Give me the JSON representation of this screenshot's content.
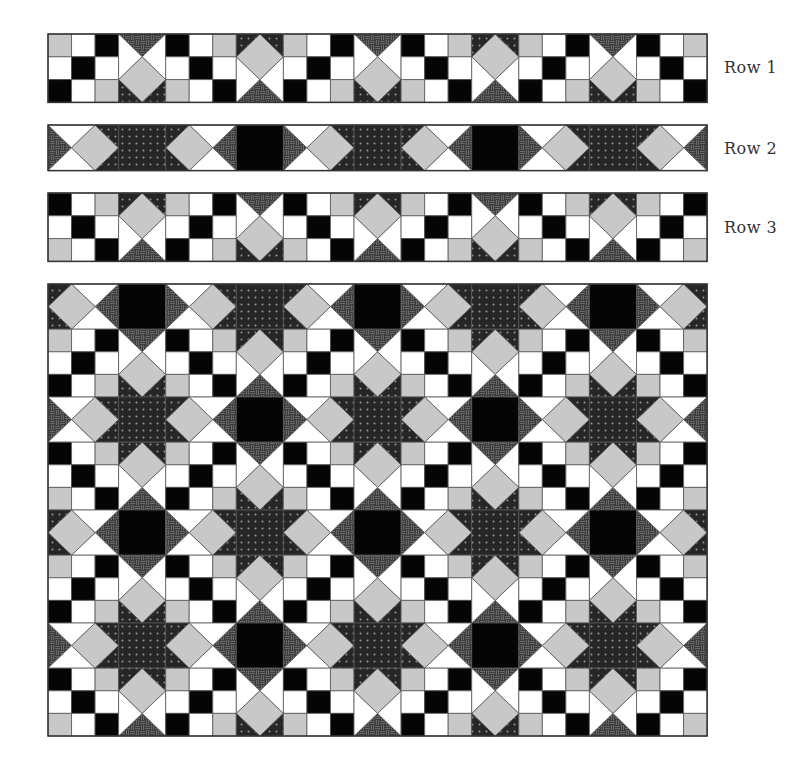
{
  "labels": {
    "row1": "Row 1",
    "row2": "Row 2",
    "row3": "Row 3"
  },
  "label_positions": {
    "row1": {
      "x": 724,
      "y": 58
    },
    "row2": {
      "x": 724,
      "y": 139
    },
    "row3": {
      "x": 724,
      "y": 218
    }
  },
  "colors": {
    "white": "#ffffff",
    "gray": "#c8c8c8",
    "black": "#050505",
    "dotted_bg": "#262626",
    "dotted_dot": "#9a9a9a",
    "striped_bg": "#3c3c3c",
    "striped_line": "#8a8a8a",
    "outline": "#555555"
  },
  "grid": {
    "x0": 48,
    "cell_w": 23.54,
    "columns": [
      "NP",
      "D",
      "NP",
      "D",
      "NP",
      "D",
      "NP",
      "D",
      "NP",
      "D",
      "NP"
    ]
  },
  "strips": [
    {
      "name": "row-1-strip",
      "y": 34,
      "cell_h": 22.8,
      "band": "R1"
    },
    {
      "name": "row-2-strip",
      "y": 125,
      "cell_h": 22.8,
      "band": "R2"
    },
    {
      "name": "row-3-strip",
      "y": 193,
      "cell_h": 22.8,
      "band": "R3"
    }
  ],
  "assembled_quilt": {
    "name": "assembled-quilt",
    "y": 284,
    "cell_h": 22.6,
    "bands": [
      "A2",
      "R1",
      "R2",
      "R3",
      "A2",
      "R1",
      "R2",
      "R3"
    ]
  },
  "band_defs": {
    "R1": {
      "height_cells": 3,
      "blocks": [
        "NPB",
        "DT",
        "NPA",
        "DB",
        "NPB",
        "DT",
        "NPA",
        "DB",
        "NPB",
        "DT",
        "NPA"
      ]
    },
    "R3": {
      "height_cells": 3,
      "blocks": [
        "NPA",
        "DB",
        "NPB",
        "DT",
        "NPA",
        "DB",
        "NPB",
        "DT",
        "NPA",
        "DB",
        "NPB"
      ]
    },
    "R2": {
      "height_cells": 2,
      "blocks": [
        "HL",
        "DOT",
        "HR",
        "BLK",
        "HL",
        "DOT",
        "HR",
        "BLK",
        "HL",
        "DOT",
        "HR"
      ]
    },
    "A2": {
      "height_cells": 2,
      "blocks": [
        "HR",
        "BLK",
        "HL",
        "DOT",
        "HR",
        "BLK",
        "HL",
        "DOT",
        "HR",
        "BLK",
        "HL"
      ]
    }
  },
  "nine_patch": {
    "NPA": [
      [
        "black",
        "white",
        "gray"
      ],
      [
        "white",
        "black",
        "white"
      ],
      [
        "gray",
        "white",
        "black"
      ]
    ],
    "NPB": [
      [
        "gray",
        "white",
        "black"
      ],
      [
        "white",
        "black",
        "white"
      ],
      [
        "black",
        "white",
        "gray"
      ]
    ]
  },
  "fabric_legend": [
    "white",
    "gray",
    "black",
    "dotted",
    "striped"
  ]
}
